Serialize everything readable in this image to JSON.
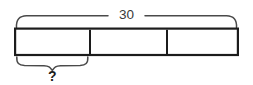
{
  "diagram": {
    "type": "tape-diagram",
    "title": "",
    "total_label": "30",
    "unknown_label": "?",
    "segments": [
      {
        "name": "segment-1",
        "label": "",
        "braced_below": true
      },
      {
        "name": "segment-2",
        "label": "",
        "braced_below": false
      },
      {
        "name": "segment-3",
        "label": "",
        "braced_below": false
      }
    ],
    "segment_count": 3,
    "top_brace": {
      "name": "total-brace",
      "spans": "all-segments",
      "label": "30"
    },
    "bottom_brace": {
      "name": "unknown-brace",
      "spans": "segment-1",
      "label": "?"
    },
    "colors": {
      "bar_stroke": "#1c1c1c",
      "bar_fill": "#ffffff",
      "brace_stroke": "#4a4a4a",
      "total_text": "#3a3a3a",
      "unknown_text": "#1c1c1c",
      "background": "#ffffff"
    }
  }
}
